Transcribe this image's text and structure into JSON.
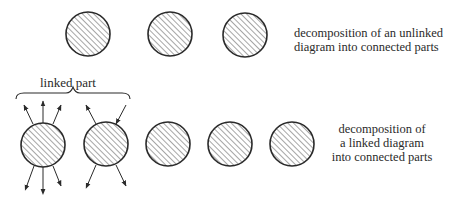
{
  "figure": {
    "top_row": {
      "caption_lines": [
        "decomposition of an unlinked",
        "diagram into connected parts"
      ],
      "circles": [
        {
          "cx": 88,
          "cy": 34,
          "r": 22
        },
        {
          "cx": 170,
          "cy": 34,
          "r": 22
        },
        {
          "cx": 245,
          "cy": 35,
          "r": 22
        }
      ]
    },
    "bottom_row": {
      "brace_label": "linked part",
      "caption_lines": [
        "decomposition of",
        "a linked diagram",
        "into connected parts"
      ],
      "circles": [
        {
          "cx": 43,
          "cy": 145,
          "r": 22
        },
        {
          "cx": 106,
          "cy": 144,
          "r": 22
        },
        {
          "cx": 168,
          "cy": 144,
          "r": 22
        },
        {
          "cx": 230,
          "cy": 144,
          "r": 22
        },
        {
          "cx": 292,
          "cy": 144,
          "r": 22
        }
      ]
    },
    "colors": {
      "stroke": "#2a2a2a",
      "hatch": "#3a3a3a",
      "background": "#ffffff"
    }
  }
}
